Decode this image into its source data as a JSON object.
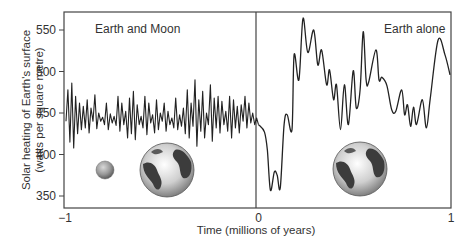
{
  "chart_data": {
    "type": "line",
    "title": "",
    "xlabel": "Time (millions of years)",
    "ylabel": "Solar heating of Earth's surface",
    "ylabel_units": "(watts per square metre)",
    "xlim": [
      -1,
      1
    ],
    "ylim": [
      335,
      565
    ],
    "x_ticks": [
      "−1",
      "0",
      "1"
    ],
    "y_ticks": [
      "350",
      "400",
      "450",
      "500",
      "550"
    ],
    "grid": false,
    "panels": [
      {
        "label": "Earth and Moon",
        "x_range": [
          -1,
          0
        ],
        "icons": [
          "moon",
          "earth"
        ]
      },
      {
        "label": "Earth alone",
        "x_range": [
          0,
          1
        ],
        "icons": [
          "earth"
        ]
      }
    ],
    "series": [
      {
        "name": "Earth and Moon",
        "x": [
          -1.0,
          -0.99,
          -0.98,
          -0.97,
          -0.96,
          -0.95,
          -0.94,
          -0.93,
          -0.92,
          -0.91,
          -0.9,
          -0.89,
          -0.88,
          -0.87,
          -0.86,
          -0.85,
          -0.84,
          -0.83,
          -0.82,
          -0.81,
          -0.8,
          -0.79,
          -0.78,
          -0.77,
          -0.76,
          -0.75,
          -0.74,
          -0.73,
          -0.72,
          -0.71,
          -0.7,
          -0.69,
          -0.68,
          -0.67,
          -0.66,
          -0.65,
          -0.64,
          -0.63,
          -0.62,
          -0.61,
          -0.6,
          -0.59,
          -0.58,
          -0.57,
          -0.56,
          -0.55,
          -0.54,
          -0.53,
          -0.52,
          -0.51,
          -0.5,
          -0.49,
          -0.48,
          -0.47,
          -0.46,
          -0.45,
          -0.44,
          -0.43,
          -0.42,
          -0.41,
          -0.4,
          -0.39,
          -0.38,
          -0.37,
          -0.36,
          -0.35,
          -0.34,
          -0.33,
          -0.32,
          -0.31,
          -0.3,
          -0.29,
          -0.28,
          -0.27,
          -0.26,
          -0.25,
          -0.24,
          -0.23,
          -0.22,
          -0.21,
          -0.2,
          -0.19,
          -0.18,
          -0.17,
          -0.16,
          -0.15,
          -0.14,
          -0.13,
          -0.12,
          -0.11,
          -0.1,
          -0.09,
          -0.08,
          -0.07,
          -0.06,
          -0.05,
          -0.04,
          -0.03,
          -0.02,
          -0.01,
          0.0
        ],
        "values": [
          440,
          478,
          415,
          486,
          408,
          470,
          425,
          462,
          430,
          458,
          432,
          466,
          426,
          456,
          440,
          472,
          431,
          450,
          440,
          445,
          436,
          462,
          430,
          449,
          438,
          446,
          435,
          470,
          428,
          462,
          436,
          452,
          420,
          468,
          425,
          476,
          418,
          460,
          436,
          446,
          432,
          470,
          424,
          462,
          438,
          448,
          426,
          466,
          430,
          450,
          440,
          462,
          428,
          452,
          436,
          444,
          432,
          468,
          430,
          448,
          434,
          456,
          425,
          478,
          420,
          462,
          434,
          490,
          410,
          466,
          428,
          476,
          420,
          450,
          436,
          484,
          416,
          468,
          432,
          470,
          426,
          464,
          436,
          452,
          428,
          470,
          420,
          466,
          432,
          458,
          426,
          460,
          440,
          470,
          432,
          462,
          438,
          450,
          436,
          444,
          436
        ]
      },
      {
        "name": "Earth alone",
        "x": [
          0.0,
          0.031,
          0.046,
          0.062,
          0.082,
          0.097,
          0.113,
          0.133,
          0.149,
          0.174,
          0.185,
          0.21,
          0.231,
          0.256,
          0.287,
          0.308,
          0.328,
          0.354,
          0.369,
          0.39,
          0.405,
          0.426,
          0.446,
          0.467,
          0.492,
          0.508,
          0.528,
          0.544,
          0.559,
          0.572,
          0.61,
          0.626,
          0.641,
          0.667,
          0.692,
          0.713,
          0.744,
          0.759,
          0.774,
          0.79,
          0.805,
          0.821,
          0.851,
          0.872,
          0.892,
          0.933,
          0.969,
          0.995
        ],
        "values": [
          436,
          427,
          405,
          357,
          379,
          375,
          360,
          436,
          448,
          430,
          520,
          490,
          564,
          523,
          550,
          508,
          526,
          484,
          502,
          466,
          484,
          430,
          484,
          436,
          501,
          456,
          478,
          548,
          490,
          487,
          526,
          490,
          493,
          483,
          454,
          452,
          478,
          448,
          460,
          434,
          457,
          436,
          466,
          432,
          467,
          538,
          520,
          496
        ]
      }
    ]
  }
}
